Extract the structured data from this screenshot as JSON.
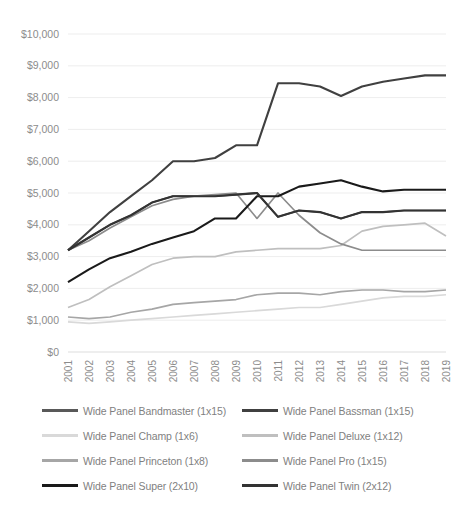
{
  "chart_data": {
    "type": "line",
    "title": "",
    "xlabel": "",
    "ylabel": "",
    "grid": true,
    "legend_position": "bottom",
    "ylim": [
      0,
      10000
    ],
    "ytick_labels": [
      "$10,000",
      "$9,000",
      "$8,000",
      "$7,000",
      "$6,000",
      "$5,000",
      "$4,000",
      "$3,000",
      "$2,000",
      "$1,000",
      "$0"
    ],
    "ytick_values": [
      10000,
      9000,
      8000,
      7000,
      6000,
      5000,
      4000,
      3000,
      2000,
      1000,
      0
    ],
    "categories": [
      "2001",
      "2002",
      "2003",
      "2004",
      "2005",
      "2006",
      "2007",
      "2008",
      "2009",
      "2010",
      "2011",
      "2012",
      "2013",
      "2014",
      "2015",
      "2016",
      "2017",
      "2018",
      "2019"
    ],
    "x": [
      2001,
      2002,
      2003,
      2004,
      2005,
      2006,
      2007,
      2008,
      2009,
      2010,
      2011,
      2012,
      2013,
      2014,
      2015,
      2016,
      2017,
      2018,
      2019
    ],
    "series": [
      {
        "name": "Wide Panel Bandmaster (1x15)",
        "color": "#595959",
        "values": [
          3200,
          3600,
          4000,
          4300,
          4700,
          4900,
          4900,
          4900,
          4950,
          5000,
          4250,
          4450,
          4400,
          4200,
          4400,
          4400,
          4450,
          4450,
          4450
        ]
      },
      {
        "name": "Wide Panel Bassman (1x15)",
        "color": "#404040",
        "values": [
          3200,
          3800,
          4400,
          4900,
          5400,
          6000,
          6000,
          6100,
          6500,
          6500,
          8450,
          8450,
          8350,
          8050,
          8350,
          8500,
          8600,
          8700,
          8700
        ]
      },
      {
        "name": "Wide Panel Champ (1x6)",
        "color": "#d9d9d9",
        "values": [
          950,
          900,
          950,
          1000,
          1050,
          1100,
          1150,
          1200,
          1250,
          1300,
          1350,
          1400,
          1400,
          1500,
          1600,
          1700,
          1750,
          1750,
          1800
        ]
      },
      {
        "name": "Wide Panel Deluxe (1x12)",
        "color": "#bfbfbf",
        "values": [
          1400,
          1650,
          2050,
          2400,
          2750,
          2950,
          3000,
          3000,
          3150,
          3200,
          3250,
          3250,
          3250,
          3350,
          3800,
          3950,
          4000,
          4050,
          3650
        ]
      },
      {
        "name": "Wide Panel Princeton (1x8)",
        "color": "#a6a6a6",
        "values": [
          1100,
          1050,
          1100,
          1250,
          1350,
          1500,
          1550,
          1600,
          1650,
          1800,
          1850,
          1850,
          1800,
          1900,
          1950,
          1950,
          1900,
          1900,
          1950
        ]
      },
      {
        "name": "Wide Panel Pro (1x15)",
        "color": "#8c8c8c",
        "values": [
          3200,
          3500,
          3900,
          4250,
          4600,
          4800,
          4900,
          4950,
          5000,
          4200,
          5000,
          4300,
          3750,
          3400,
          3200,
          3200,
          3200,
          3200,
          3200
        ]
      },
      {
        "name": "Wide Panel Super (2x10)",
        "color": "#1a1a1a",
        "values": [
          2200,
          2600,
          2950,
          3150,
          3400,
          3600,
          3800,
          4200,
          4200,
          4900,
          4900,
          5200,
          5300,
          5400,
          5200,
          5050,
          5100,
          5100,
          5100
        ]
      },
      {
        "name": "Wide Panel Twin (2x12)",
        "color": "#333333",
        "values": [
          3200,
          3600,
          4000,
          4300,
          4700,
          4900,
          4900,
          4900,
          4950,
          5000,
          4250,
          4450,
          4400,
          4200,
          4400,
          4400,
          4450,
          4450,
          4450
        ]
      }
    ]
  },
  "legend": {
    "items": [
      {
        "label": "Wide Panel Bandmaster (1x15)",
        "color": "#595959"
      },
      {
        "label": "Wide Panel Bassman (1x15)",
        "color": "#404040"
      },
      {
        "label": "Wide Panel Champ (1x6)",
        "color": "#d9d9d9"
      },
      {
        "label": "Wide Panel Deluxe (1x12)",
        "color": "#bfbfbf"
      },
      {
        "label": "Wide Panel Princeton (1x8)",
        "color": "#a6a6a6"
      },
      {
        "label": "Wide Panel Pro (1x15)",
        "color": "#8c8c8c"
      },
      {
        "label": "Wide Panel Super (2x10)",
        "color": "#1a1a1a"
      },
      {
        "label": "Wide Panel Twin (2x12)",
        "color": "#333333"
      }
    ]
  }
}
